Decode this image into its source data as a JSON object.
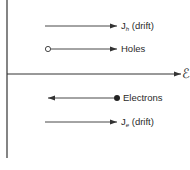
{
  "diagram": {
    "title": "",
    "colors": {
      "line": "#333333",
      "background": "#ffffff"
    },
    "axes": {
      "vertical": {
        "x": 7,
        "y1": 0,
        "y2": 158
      },
      "horizontal": {
        "y": 74,
        "x1": 7,
        "x2": 182,
        "label": "ℰ",
        "label_meaning": "electric field"
      }
    },
    "rows": [
      {
        "id": "jh",
        "y": 26,
        "direction": "right",
        "marker": "none",
        "label_main": "J",
        "label_sub": "h",
        "label_suffix": " (drift)"
      },
      {
        "id": "holes",
        "y": 49,
        "direction": "right",
        "marker": "open-circle",
        "label_main": "Holes",
        "label_sub": "",
        "label_suffix": ""
      },
      {
        "id": "electrons",
        "y": 98,
        "direction": "left",
        "marker": "filled-circle",
        "label_main": "Electrons",
        "label_sub": "",
        "label_suffix": ""
      },
      {
        "id": "je",
        "y": 122,
        "direction": "right",
        "marker": "none",
        "label_main": "J",
        "label_sub": "e",
        "label_suffix": " (drift)"
      }
    ]
  }
}
